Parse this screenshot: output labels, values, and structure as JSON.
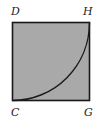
{
  "figure": {
    "labels": {
      "top_left": "D",
      "top_right": "H",
      "bottom_left": "C",
      "bottom_right": "G"
    },
    "colors": {
      "fill": "#a9a9a9",
      "stroke": "#1a1a1a"
    },
    "shape": "square with quarter-circle arc from C to H"
  }
}
